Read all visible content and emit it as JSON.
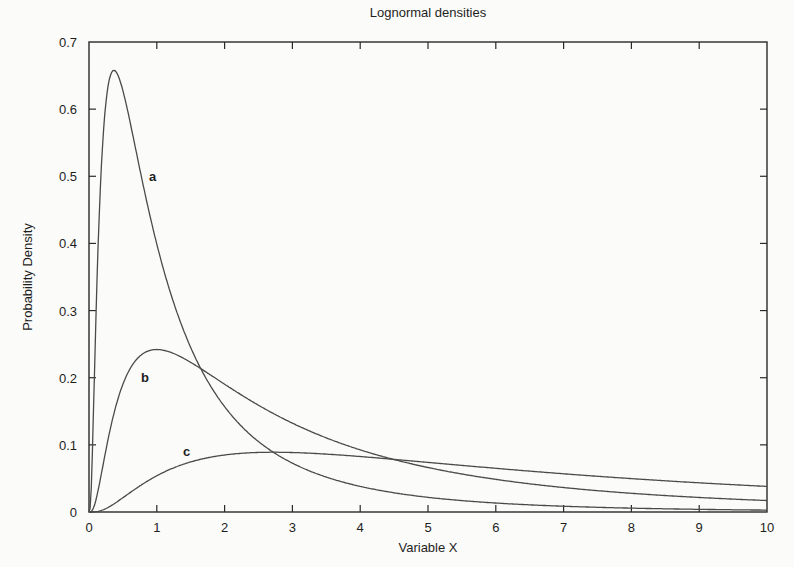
{
  "chart_data": {
    "type": "line",
    "title": "Lognormal densities",
    "xlabel": "Variable X",
    "ylabel": "Probability Density",
    "xlim": [
      0,
      10
    ],
    "ylim": [
      0,
      0.7
    ],
    "xticks": [
      "0",
      "1",
      "2",
      "3",
      "4",
      "5",
      "6",
      "7",
      "8",
      "9",
      "10"
    ],
    "yticks": [
      "0",
      "0.1",
      "0.2",
      "0.3",
      "0.4",
      "0.5",
      "0.6",
      "0.7"
    ],
    "grid": false,
    "legend": "none (curves labeled inline)",
    "x": [
      0.1,
      0.2,
      0.3,
      0.4,
      0.5,
      0.75,
      1,
      1.5,
      2,
      2.5,
      3,
      4,
      5,
      6,
      7,
      8,
      9,
      10
    ],
    "series": [
      {
        "name": "a",
        "mu": 0,
        "sigma": 1,
        "label_pos": [
          0.93,
          0.5
        ],
        "values": [
          0.028,
          0.5,
          0.644,
          0.655,
          0.627,
          0.509,
          0.399,
          0.245,
          0.157,
          0.105,
          0.073,
          0.038,
          0.022,
          0.014,
          0.009,
          0.006,
          0.004,
          0.003
        ]
      },
      {
        "name": "b",
        "mu": 1,
        "sigma": 1,
        "label_pos": [
          0.83,
          0.2
        ],
        "values": [
          0.0001,
          0.008,
          0.029,
          0.058,
          0.089,
          0.16,
          0.242,
          0.231,
          0.194,
          0.159,
          0.131,
          0.091,
          0.066,
          0.049,
          0.038,
          0.03,
          0.024,
          0.019
        ]
      },
      {
        "name": "c",
        "mu": 2,
        "sigma": 1,
        "label_pos": [
          1.45,
          0.09
        ],
        "values": [
          0.0,
          0.0001,
          0.002,
          0.005,
          0.009,
          0.021,
          0.054,
          0.072,
          0.083,
          0.088,
          0.089,
          0.086,
          0.08,
          0.073,
          0.066,
          0.059,
          0.053,
          0.048
        ]
      }
    ]
  },
  "labels": {
    "title": "Lognormal densities",
    "xlabel": "Variable X",
    "ylabel": "Probability Density",
    "curve_a": "a",
    "curve_b": "b",
    "curve_c": "c"
  },
  "colors": {
    "axis": "#2a2a2a",
    "curve": "#4a4a4a",
    "background": "#fbfbf9"
  }
}
